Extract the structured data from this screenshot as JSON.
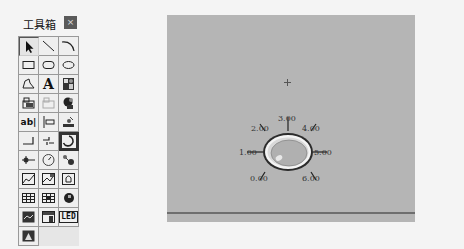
{
  "toolbox": {
    "title": "工具箱",
    "close_label": "×",
    "tools": [
      {
        "name": "pointer",
        "label": ""
      },
      {
        "name": "line",
        "label": ""
      },
      {
        "name": "arc",
        "label": ""
      },
      {
        "name": "rectangle",
        "label": ""
      },
      {
        "name": "rounded-rectangle",
        "label": ""
      },
      {
        "name": "ellipse",
        "label": ""
      },
      {
        "name": "polygon",
        "label": ""
      },
      {
        "name": "text",
        "label": "A"
      },
      {
        "name": "bitmap",
        "label": ""
      },
      {
        "name": "symbol-library",
        "label": ""
      },
      {
        "name": "ole-object",
        "label": ""
      },
      {
        "name": "activex",
        "label": ""
      },
      {
        "name": "input-box",
        "label": "ab|"
      },
      {
        "name": "slider",
        "label": ""
      },
      {
        "name": "animation",
        "label": ""
      },
      {
        "name": "pipe",
        "label": ""
      },
      {
        "name": "flow-line",
        "label": ""
      },
      {
        "name": "dial-meter",
        "label": ""
      },
      {
        "name": "valve",
        "label": ""
      },
      {
        "name": "gauge",
        "label": ""
      },
      {
        "name": "pump",
        "label": ""
      },
      {
        "name": "trend-chart",
        "label": ""
      },
      {
        "name": "xy-chart",
        "label": ""
      },
      {
        "name": "alarm-window",
        "label": ""
      },
      {
        "name": "grid-table",
        "label": ""
      },
      {
        "name": "report-table",
        "label": ""
      },
      {
        "name": "custom-control",
        "label": ""
      },
      {
        "name": "history-curve",
        "label": ""
      },
      {
        "name": "data-window",
        "label": ""
      },
      {
        "name": "led-display",
        "label": "LED"
      },
      {
        "name": "event-window",
        "label": ""
      }
    ],
    "selected_tool": "dial-meter"
  },
  "canvas": {
    "background": "#b5b5b5",
    "dial": {
      "tick_labels": [
        "0.00",
        "1.00",
        "2.00",
        "3.00",
        "4.00",
        "5.00",
        "6.00"
      ]
    }
  }
}
